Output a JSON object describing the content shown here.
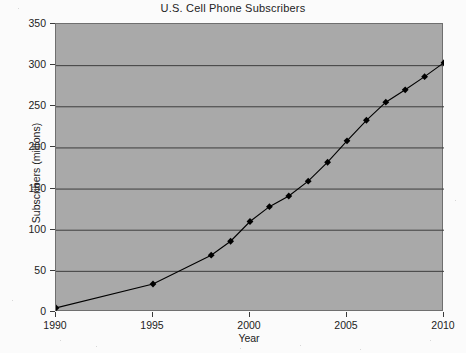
{
  "chart_data": {
    "type": "line",
    "title": "U.S. Cell Phone Subscribers",
    "xlabel": "Year",
    "ylabel": "Subscribers (millions)",
    "xlim": [
      1990,
      2010
    ],
    "ylim": [
      0,
      350
    ],
    "xticks": [
      1990,
      1995,
      2000,
      2005,
      2010
    ],
    "yticks": [
      0,
      50,
      100,
      150,
      200,
      250,
      300,
      350
    ],
    "grid": "horizontal",
    "legend": "none",
    "marker": "filled-diamond",
    "series": [
      {
        "name": "Subscribers",
        "color": "#000000",
        "x": [
          1990,
          1995,
          1998,
          1999,
          2000,
          2001,
          2002,
          2003,
          2004,
          2005,
          2006,
          2007,
          2008,
          2009,
          2010
        ],
        "values": [
          5,
          34,
          69,
          86,
          110,
          128,
          141,
          159,
          182,
          208,
          233,
          255,
          270,
          286,
          303
        ]
      }
    ],
    "annotations": []
  },
  "axis": {
    "y_tick_labels": [
      "350",
      "300",
      "250",
      "200",
      "150",
      "100",
      "50",
      "0"
    ],
    "x_tick_labels": [
      "1990",
      "1995",
      "2000",
      "2005",
      "2010"
    ]
  },
  "colors": {
    "plot_background": "#a9a9a9",
    "figure_background": "#fbfbfb",
    "gridline": "#3d3d3d",
    "axis": "#6f6f6f",
    "series": "#000000",
    "text": "#222222"
  }
}
